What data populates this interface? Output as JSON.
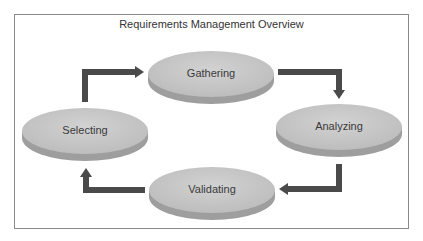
{
  "diagram": {
    "title": "Requirements Management Overview",
    "nodes": [
      {
        "id": "gathering",
        "label": "Gathering"
      },
      {
        "id": "analyzing",
        "label": "Analyzing"
      },
      {
        "id": "validating",
        "label": "Validating"
      },
      {
        "id": "selecting",
        "label": "Selecting"
      }
    ],
    "edges": [
      {
        "from": "selecting",
        "to": "gathering"
      },
      {
        "from": "gathering",
        "to": "analyzing"
      },
      {
        "from": "analyzing",
        "to": "validating"
      },
      {
        "from": "validating",
        "to": "selecting"
      }
    ],
    "colors": {
      "node_top": "#c8c8c8",
      "node_side": "#a5a5a5",
      "arrow": "#4a4a4a",
      "border": "#8a8a8a"
    }
  }
}
